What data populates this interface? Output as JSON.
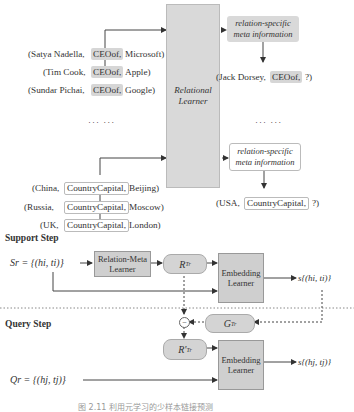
{
  "top": {
    "ceo_triples": [
      {
        "head": "(Satya Nadella,",
        "relation": "CEOof,",
        "tail": "Microsoft)"
      },
      {
        "head": "(Tim Cook,",
        "relation": "CEOof,",
        "tail": "Apple)"
      },
      {
        "head": "(Sundar Pichai,",
        "relation": "CEOof,",
        "tail": "Google)"
      }
    ],
    "ellipsis_left": "··· ···",
    "ellipsis_right": "··· ···",
    "capital_triples": [
      {
        "head": "(China,",
        "relation": "CountryCapital,",
        "tail": "Beijing)"
      },
      {
        "head": "(Russia,",
        "relation": "CountryCapital,",
        "tail": "Moscow)"
      },
      {
        "head": "(UK,",
        "relation": "CountryCapital,",
        "tail": "London)"
      }
    ],
    "relational_learner": "Relational Learner",
    "meta_info_1": "relation-specific meta information",
    "meta_info_2": "relation-specific meta information",
    "query_ceo": {
      "head": "(Jack Dorsey,",
      "relation": "CEOof,",
      "tail": "?)"
    },
    "query_capital": {
      "head": "(USA,",
      "relation": "CountryCapital,",
      "tail": "?)"
    }
  },
  "support": {
    "title": "Support Step",
    "set_label": "Sr = {(hi, ti)}",
    "relation_meta_learner": "Relation-Meta Learner",
    "r_label": "R",
    "r_sub": "Tr",
    "embedding_learner": "Embedding Learner",
    "score_label": "s{(hi, ti)}"
  },
  "gradient": {
    "g_label": "G",
    "g_sub": "Tr",
    "minus_symbol": "−"
  },
  "query": {
    "title": "Query Step",
    "set_label": "Qr = {(hj, tj)}",
    "r_prime_label": "R'",
    "r_prime_sub": "Tr",
    "embedding_learner": "Embedding Learner",
    "score_label": "s{(hj, tj)}"
  },
  "caption": "图 2.11  利用元学习的少样本链接预测"
}
